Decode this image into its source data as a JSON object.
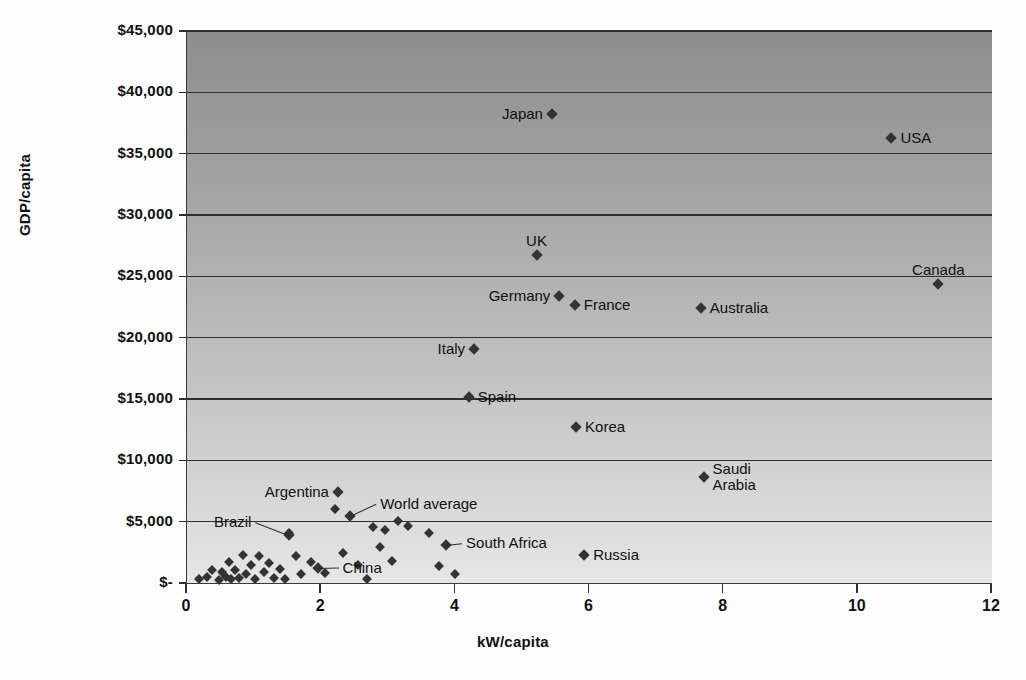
{
  "chart_data": {
    "type": "scatter",
    "title": "",
    "xlabel": "kW/capita",
    "ylabel": "GDP/capita",
    "xlim": [
      0,
      12
    ],
    "ylim": [
      0,
      45000
    ],
    "xticks": [
      "0",
      "2",
      "4",
      "6",
      "8",
      "10",
      "12"
    ],
    "xtick_values": [
      0,
      2,
      4,
      6,
      8,
      10,
      12
    ],
    "yticks": [
      "$-",
      "$5,000",
      "$10,000",
      "$15,000",
      "$20,000",
      "$25,000",
      "$30,000",
      "$35,000",
      "$40,000",
      "$45,000"
    ],
    "ytick_values": [
      0,
      5000,
      10000,
      15000,
      20000,
      25000,
      30000,
      35000,
      40000,
      45000
    ],
    "grid": "horizontal",
    "legend": "none",
    "background": "gray-gradient-dark-top-to-light-bottom",
    "marker_color": "#333333",
    "marker_shape": "diamond",
    "labeled_points": [
      {
        "name": "Japan",
        "x": 5.44,
        "y": 38200,
        "label_pos": "left"
      },
      {
        "name": "USA",
        "x": 10.5,
        "y": 36300,
        "label_pos": "right"
      },
      {
        "name": "UK",
        "x": 5.21,
        "y": 26700,
        "label_pos": "above"
      },
      {
        "name": "Canada",
        "x": 11.2,
        "y": 24400,
        "label_pos": "above"
      },
      {
        "name": "Germany",
        "x": 5.55,
        "y": 23400,
        "label_pos": "left"
      },
      {
        "name": "France",
        "x": 5.78,
        "y": 22700,
        "label_pos": "right"
      },
      {
        "name": "Australia",
        "x": 7.66,
        "y": 22400,
        "label_pos": "right"
      },
      {
        "name": "Italy",
        "x": 4.28,
        "y": 19100,
        "label_pos": "left"
      },
      {
        "name": "Spain",
        "x": 4.2,
        "y": 15200,
        "label_pos": "right"
      },
      {
        "name": "Korea",
        "x": 5.8,
        "y": 12700,
        "label_pos": "right"
      },
      {
        "name": "Saudi Arabia",
        "x": 7.7,
        "y": 8650,
        "label_pos": "right",
        "lines": [
          "Saudi",
          "Arabia"
        ]
      },
      {
        "name": "Argentina",
        "x": 2.25,
        "y": 7400,
        "label_pos": "left"
      },
      {
        "name": "World average",
        "x": 2.43,
        "y": 5450,
        "label_pos": "leader"
      },
      {
        "name": "Brazil",
        "x": 1.52,
        "y": 3950,
        "label_pos": "leader"
      },
      {
        "name": "South Africa",
        "x": 3.86,
        "y": 3100,
        "label_pos": "leader"
      },
      {
        "name": "Russia",
        "x": 5.92,
        "y": 2250,
        "label_pos": "right"
      },
      {
        "name": "China",
        "x": 1.95,
        "y": 1200,
        "label_pos": "leader"
      }
    ],
    "unlabeled_points": [
      {
        "x": 0.18,
        "y": 300
      },
      {
        "x": 0.3,
        "y": 450
      },
      {
        "x": 0.38,
        "y": 1050
      },
      {
        "x": 0.47,
        "y": 250
      },
      {
        "x": 0.52,
        "y": 900
      },
      {
        "x": 0.58,
        "y": 500
      },
      {
        "x": 0.62,
        "y": 1750
      },
      {
        "x": 0.66,
        "y": 300
      },
      {
        "x": 0.72,
        "y": 1100
      },
      {
        "x": 0.78,
        "y": 400
      },
      {
        "x": 0.84,
        "y": 2250
      },
      {
        "x": 0.88,
        "y": 750
      },
      {
        "x": 0.95,
        "y": 1500
      },
      {
        "x": 1.02,
        "y": 350
      },
      {
        "x": 1.08,
        "y": 2200
      },
      {
        "x": 1.15,
        "y": 900
      },
      {
        "x": 1.22,
        "y": 1600
      },
      {
        "x": 1.3,
        "y": 400
      },
      {
        "x": 1.38,
        "y": 1150
      },
      {
        "x": 1.46,
        "y": 350
      },
      {
        "x": 1.52,
        "y": 4050
      },
      {
        "x": 1.62,
        "y": 2200
      },
      {
        "x": 1.7,
        "y": 750
      },
      {
        "x": 1.85,
        "y": 1700
      },
      {
        "x": 2.05,
        "y": 800
      },
      {
        "x": 2.2,
        "y": 6000
      },
      {
        "x": 2.32,
        "y": 2450
      },
      {
        "x": 2.55,
        "y": 1450
      },
      {
        "x": 2.68,
        "y": 300
      },
      {
        "x": 2.78,
        "y": 4600
      },
      {
        "x": 2.88,
        "y": 2950
      },
      {
        "x": 2.95,
        "y": 4300
      },
      {
        "x": 3.05,
        "y": 1800
      },
      {
        "x": 3.14,
        "y": 5050
      },
      {
        "x": 3.3,
        "y": 4650
      },
      {
        "x": 3.6,
        "y": 4050
      },
      {
        "x": 3.75,
        "y": 1350
      },
      {
        "x": 4.0,
        "y": 700
      }
    ]
  },
  "axis": {
    "x_title": "kW/capita",
    "y_title": "GDP/capita"
  }
}
